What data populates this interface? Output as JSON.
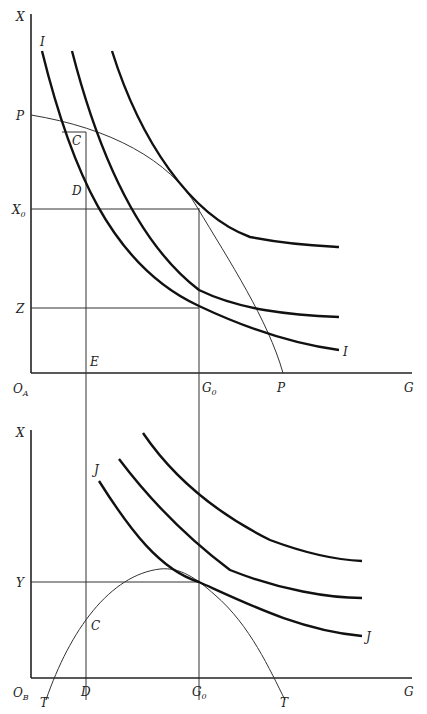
{
  "top_panel": {
    "origin": "O",
    "origin_sub": "A",
    "y_axis": "X",
    "x_axis": "G",
    "labels": {
      "P_y": "P",
      "P_x": "P",
      "C": "C",
      "D": "D",
      "X0": "X",
      "X0_sub": "0",
      "Z": "Z",
      "E": "E",
      "G0": "G",
      "G0_sub": "0",
      "I_top": "I",
      "I_right": "I"
    }
  },
  "bottom_panel": {
    "origin": "O",
    "origin_sub": "B",
    "y_axis": "X",
    "x_axis": "G",
    "labels": {
      "J_top": "J",
      "J_right": "J",
      "Y": "Y",
      "C": "C",
      "D": "D",
      "G0": "G",
      "G0_sub": "0",
      "T_left": "T",
      "T_right": "T"
    }
  },
  "colors": {
    "ink": "#111111",
    "background": "#ffffff"
  }
}
